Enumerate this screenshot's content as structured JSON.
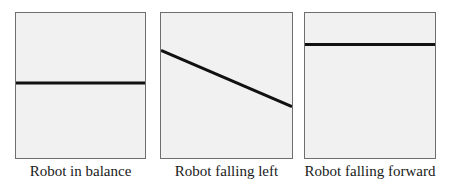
{
  "figure": {
    "panels": [
      {
        "id": "balance",
        "caption": "Robot in balance",
        "line": {
          "x1": 0,
          "y1": 71,
          "x2": 131,
          "y2": 71
        }
      },
      {
        "id": "falling-left",
        "caption": "Robot falling left",
        "line": {
          "x1": 0,
          "y1": 38,
          "x2": 133,
          "y2": 95
        }
      },
      {
        "id": "falling-forward",
        "caption": "Robot falling forward",
        "line": {
          "x1": 0,
          "y1": 32,
          "x2": 132,
          "y2": 32
        }
      }
    ],
    "colors": {
      "panel_fill": "#f1f1f1",
      "panel_border": "#6e6e6e",
      "line": "#111111",
      "caption_text": "#1a1a1a"
    }
  }
}
